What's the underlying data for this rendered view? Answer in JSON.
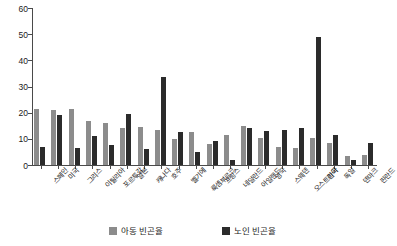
{
  "chart_data": {
    "type": "bar",
    "title": "",
    "xlabel": "",
    "ylabel": "",
    "ylim": [
      0,
      60
    ],
    "yticks": [
      0,
      10,
      20,
      30,
      40,
      50,
      60
    ],
    "grid": false,
    "legend_position": "bottom",
    "categories": [
      "스페인",
      "미국",
      "그리스",
      "이탈리아",
      "포르투갈",
      "일본",
      "캐나다",
      "호주",
      "벨기에",
      "룩셈부르크",
      "프랑스",
      "네덜란드",
      "아일랜드",
      "영국",
      "스웨덴",
      "오스트리아",
      "한국",
      "독일",
      "덴마크",
      "핀란드"
    ],
    "series": [
      {
        "name": "아동 빈곤율",
        "color": "#8c8c8c",
        "values": [
          21.5,
          21.0,
          21.5,
          17.0,
          16.0,
          14.0,
          14.5,
          13.5,
          10.0,
          12.5,
          8.0,
          11.5,
          15.0,
          10.5,
          7.0,
          6.5,
          10.5,
          8.5,
          3.5,
          4.0
        ]
      },
      {
        "name": "노인 빈곤율",
        "color": "#2b2b2b",
        "values": [
          6.8,
          19.0,
          6.5,
          11.0,
          7.5,
          19.5,
          6.0,
          33.5,
          12.5,
          5.0,
          9.0,
          2.0,
          14.0,
          13.0,
          13.5,
          14.0,
          49.0,
          11.5,
          2.0,
          8.5
        ]
      }
    ],
    "legend": [
      {
        "label": "아동 빈곤율",
        "color": "#8c8c8c",
        "swatch_icon": "square-swatch-light"
      },
      {
        "label": "노인 빈곤율",
        "color": "#2b2b2b",
        "swatch_icon": "square-swatch-dark"
      }
    ]
  }
}
